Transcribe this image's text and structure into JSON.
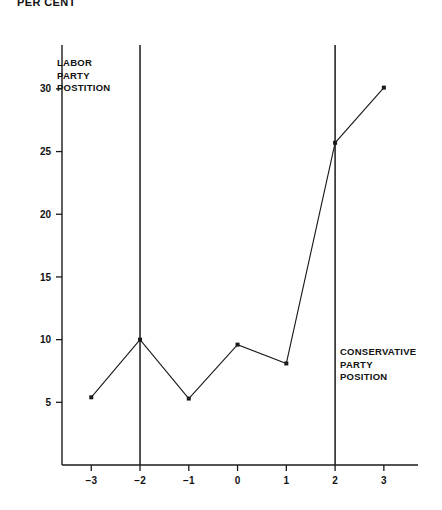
{
  "chart_data": {
    "type": "line",
    "title": "PER CENT",
    "xlabel": "",
    "ylabel": "",
    "x": [
      -3,
      -2,
      -1,
      0,
      1,
      2,
      3
    ],
    "values": [
      5.4,
      10.0,
      5.3,
      9.6,
      8.1,
      25.7,
      30.1
    ],
    "series": [
      {
        "name": "per cent",
        "x": [
          -3,
          -2,
          -1,
          0,
          1,
          2,
          3
        ],
        "values": [
          5.4,
          10.0,
          5.3,
          9.6,
          8.1,
          25.7,
          30.1
        ]
      }
    ],
    "xlim": [
      -3.6,
      3.7
    ],
    "ylim": [
      0,
      33.5
    ],
    "xticks": [
      -3,
      -2,
      -1,
      0,
      1,
      2,
      3
    ],
    "xtick_labels": [
      "−3",
      "−2",
      "−1",
      "0",
      "1",
      "2",
      "3"
    ],
    "yticks": [
      5,
      10,
      15,
      20,
      25,
      30
    ],
    "ytick_labels": [
      "5",
      "10",
      "15",
      "20",
      "25",
      "30"
    ],
    "grid": false,
    "legend": "none",
    "markers": "square",
    "reference_lines": [
      {
        "name": "labor-party-position",
        "x": -2,
        "label": [
          "LABOR",
          "PARTY",
          "POSTITION"
        ]
      },
      {
        "name": "conservative-party-position",
        "x": 2,
        "label": [
          "CONSERVATIVE",
          "PARTY",
          "POSITION"
        ]
      }
    ],
    "annotations": [
      {
        "id": "labor",
        "line1": "LABOR",
        "line2": "PARTY",
        "line3": "POSTITION"
      },
      {
        "id": "conservative",
        "line1": "CONSERVATIVE",
        "line2": "PARTY",
        "line3": "POSITION"
      }
    ],
    "colors": {
      "line": "#1a1a1a",
      "axis": "#1a1a1a",
      "background": "#ffffff"
    }
  }
}
